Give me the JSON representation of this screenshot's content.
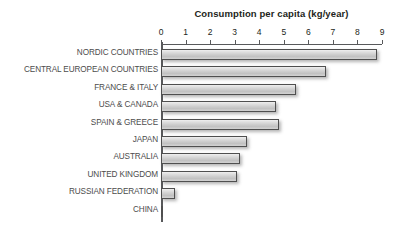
{
  "chart_data": {
    "type": "bar",
    "orientation": "horizontal",
    "title": "Consumption per capita (kg/year)",
    "xlabel": "",
    "ylabel": "",
    "xlim": [
      0,
      9
    ],
    "grid": false,
    "legend": null,
    "tick_labels": [
      "0",
      "1",
      "2",
      "3",
      "4",
      "5",
      "6",
      "7",
      "8",
      "9"
    ],
    "tick_values": [
      0,
      1,
      2,
      3,
      4,
      5,
      6,
      7,
      8,
      9
    ],
    "categories": [
      "NORDIC COUNTRIES",
      "CENTRAL EUROPEAN COUNTRIES",
      "FRANCE & ITALY",
      "USA & CANADA",
      "SPAIN & GREECE",
      "JAPAN",
      "AUSTRALIA",
      "UNITED KINGDOM",
      "RUSSIAN FEDERATION",
      "CHINA"
    ],
    "values": [
      8.8,
      6.7,
      5.5,
      4.7,
      4.8,
      3.5,
      3.2,
      3.1,
      0.55,
      0.1
    ],
    "bar_fill_color": "#cfcfcf",
    "bar_border_color": "#4f4f4f",
    "axis_color": "#58595b",
    "title_color": "#231f20",
    "label_color": "#4c4c4c",
    "background_color": "#ffffff"
  }
}
